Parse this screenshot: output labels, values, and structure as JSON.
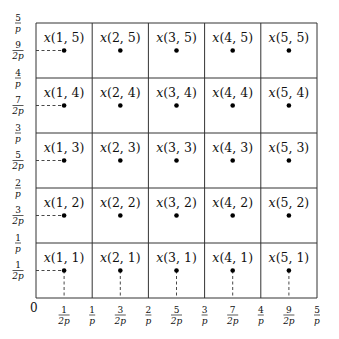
{
  "diagram": {
    "type": "grid-sample-points",
    "columns": 5,
    "rows": 5,
    "origin_label": "0",
    "point_label_prefix": "x",
    "points": [
      {
        "i": 1,
        "j": 5,
        "label": "x(1,5)"
      },
      {
        "i": 2,
        "j": 5,
        "label": "x(2,5)"
      },
      {
        "i": 3,
        "j": 5,
        "label": "x(3,5)"
      },
      {
        "i": 4,
        "j": 5,
        "label": "x(4,5)"
      },
      {
        "i": 5,
        "j": 5,
        "label": "x(5,5)"
      },
      {
        "i": 1,
        "j": 4,
        "label": "x(1,4)"
      },
      {
        "i": 2,
        "j": 4,
        "label": "x(2,4)"
      },
      {
        "i": 3,
        "j": 4,
        "label": "x(3,4)"
      },
      {
        "i": 4,
        "j": 4,
        "label": "x(4,4)"
      },
      {
        "i": 5,
        "j": 4,
        "label": "x(5,4)"
      },
      {
        "i": 1,
        "j": 3,
        "label": "x(1,3)"
      },
      {
        "i": 2,
        "j": 3,
        "label": "x(2,3)"
      },
      {
        "i": 3,
        "j": 3,
        "label": "x(3,3)"
      },
      {
        "i": 4,
        "j": 3,
        "label": "x(4,3)"
      },
      {
        "i": 5,
        "j": 3,
        "label": "x(5,3)"
      },
      {
        "i": 1,
        "j": 2,
        "label": "x(1,2)"
      },
      {
        "i": 2,
        "j": 2,
        "label": "x(2,2)"
      },
      {
        "i": 3,
        "j": 2,
        "label": "x(3,2)"
      },
      {
        "i": 4,
        "j": 2,
        "label": "x(4,2)"
      },
      {
        "i": 5,
        "j": 2,
        "label": "x(5,2)"
      },
      {
        "i": 1,
        "j": 1,
        "label": "x(1,1)"
      },
      {
        "i": 2,
        "j": 1,
        "label": "x(2,1)"
      },
      {
        "i": 3,
        "j": 1,
        "label": "x(3,1)"
      },
      {
        "i": 4,
        "j": 1,
        "label": "x(4,1)"
      },
      {
        "i": 5,
        "j": 1,
        "label": "x(5,1)"
      }
    ],
    "x_axis_ticks": [
      {
        "num": "1",
        "den": "2p",
        "pos": 0.5
      },
      {
        "num": "1",
        "den": "p",
        "pos": 1
      },
      {
        "num": "3",
        "den": "2p",
        "pos": 1.5
      },
      {
        "num": "2",
        "den": "p",
        "pos": 2
      },
      {
        "num": "5",
        "den": "2p",
        "pos": 2.5
      },
      {
        "num": "3",
        "den": "p",
        "pos": 3
      },
      {
        "num": "7",
        "den": "2p",
        "pos": 3.5
      },
      {
        "num": "4",
        "den": "p",
        "pos": 4
      },
      {
        "num": "9",
        "den": "2p",
        "pos": 4.5
      },
      {
        "num": "5",
        "den": "p",
        "pos": 5
      }
    ],
    "y_axis_ticks": [
      {
        "num": "1",
        "den": "2p",
        "pos": 0.5
      },
      {
        "num": "1",
        "den": "p",
        "pos": 1
      },
      {
        "num": "3",
        "den": "2p",
        "pos": 1.5
      },
      {
        "num": "2",
        "den": "p",
        "pos": 2
      },
      {
        "num": "5",
        "den": "2p",
        "pos": 2.5
      },
      {
        "num": "3",
        "den": "p",
        "pos": 3
      },
      {
        "num": "7",
        "den": "2p",
        "pos": 3.5
      },
      {
        "num": "4",
        "den": "p",
        "pos": 4
      },
      {
        "num": "9",
        "den": "2p",
        "pos": 4.5
      },
      {
        "num": "5",
        "den": "p",
        "pos": 5
      }
    ],
    "dashed_guides": {
      "horizontal_from_y_axis_to_column": 1,
      "vertical_from_x_axis_to_row": 1
    },
    "colors": {
      "grid": "#333333",
      "dot": "#000000",
      "text": "#111111",
      "background": "#ffffff"
    }
  }
}
